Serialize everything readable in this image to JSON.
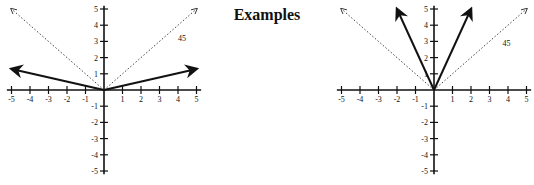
{
  "title": "Examples",
  "chart_data": [
    {
      "type": "line",
      "title": "",
      "origin_px": [
        104,
        90
      ],
      "unit_px": [
        18.5,
        16.2
      ],
      "xlim": [
        -5,
        5
      ],
      "ylim": [
        -5,
        5
      ],
      "x_ticks": [
        -5,
        -4,
        -3,
        -2,
        -1,
        1,
        2,
        3,
        4,
        5
      ],
      "y_ticks": [
        5,
        4,
        3,
        2,
        1,
        -1,
        -2,
        -3,
        -4,
        -5
      ],
      "annotation": {
        "text": "45",
        "x": 4.0,
        "y": 3.0
      },
      "series": [
        {
          "name": "y=|x| (reference)",
          "style": "dotted",
          "points": [
            [
              -5,
              5
            ],
            [
              0,
              0
            ],
            [
              5,
              5
            ]
          ]
        },
        {
          "name": "y=0.25|x|",
          "style": "solid",
          "points": [
            [
              -5,
              1.3
            ],
            [
              0,
              0
            ],
            [
              5,
              1.3
            ]
          ]
        }
      ]
    },
    {
      "type": "line",
      "title": "",
      "origin_px": [
        434,
        90
      ],
      "unit_px": [
        18.5,
        16.2
      ],
      "xlim": [
        -5,
        5
      ],
      "ylim": [
        -5,
        5
      ],
      "x_ticks": [
        -5,
        -4,
        -3,
        -2,
        -1,
        1,
        2,
        3,
        4,
        5
      ],
      "y_ticks": [
        5,
        4,
        3,
        2,
        1,
        -1,
        -2,
        -3,
        -4,
        -5
      ],
      "annotation": {
        "text": "45",
        "x": 3.7,
        "y": 2.7
      },
      "series": [
        {
          "name": "y=|x| (reference)",
          "style": "dotted",
          "points": [
            [
              -5,
              5
            ],
            [
              0,
              0
            ],
            [
              5,
              5
            ]
          ]
        },
        {
          "name": "y=2.5|x|",
          "style": "solid",
          "points": [
            [
              -2,
              5
            ],
            [
              0,
              0
            ],
            [
              2,
              5
            ]
          ]
        }
      ]
    }
  ]
}
